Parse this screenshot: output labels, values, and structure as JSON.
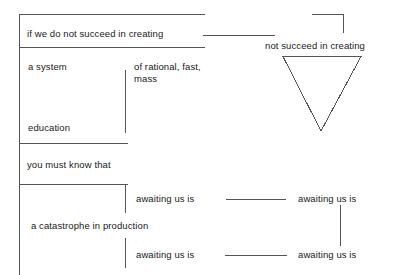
{
  "canvas": {
    "width": 407,
    "height": 275,
    "background": "#ffffff",
    "stroke_color": "#555555",
    "text_color": "#1a1a1a"
  },
  "diagram": {
    "type": "sentence-diagram",
    "nodes": [
      {
        "id": "clause-1",
        "label": "if we do not succeed in creating"
      },
      {
        "id": "subject-1",
        "label": "a system"
      },
      {
        "id": "modifier-1",
        "label": "of rational, fast,\nmass"
      },
      {
        "id": "object-1",
        "label": "education"
      },
      {
        "id": "clause-2",
        "label": "you must know that"
      },
      {
        "id": "predicate-left-top",
        "label": "awaiting us is"
      },
      {
        "id": "subject-2",
        "label": "a catastrophe in production"
      },
      {
        "id": "predicate-left-bottom",
        "label": "awaiting us is"
      },
      {
        "id": "predicate-right-top",
        "label": "awaiting us is"
      },
      {
        "id": "predicate-right-bottom",
        "label": "awaiting us is"
      },
      {
        "id": "clause-right",
        "label": "not succeed in creating"
      }
    ],
    "shapes": [
      {
        "id": "triangle",
        "name": "inverted-triangle"
      }
    ]
  },
  "labels": {
    "clause_1": "if we do not succeed in creating",
    "subject_1": "a system",
    "modifier_1": "of rational, fast,\nmass",
    "object_1": "education",
    "clause_2": "you must know that",
    "awaiting_1": "awaiting us is",
    "subject_2": "a catastrophe in production",
    "awaiting_2": "awaiting us is",
    "awaiting_3": "awaiting us is",
    "awaiting_4": "awaiting us is",
    "clause_right": "not succeed in creating"
  }
}
